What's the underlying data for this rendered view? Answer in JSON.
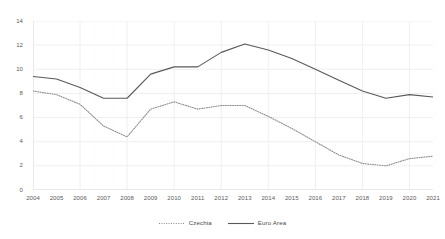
{
  "chart_data": {
    "type": "line",
    "title": "",
    "subtitle": "",
    "xlabel": "",
    "ylabel": "",
    "xlim": [
      2004,
      2021
    ],
    "ylim": [
      0,
      14
    ],
    "ytick_step": 2,
    "grid": true,
    "legend_position": "bottom",
    "x": [
      2004,
      2005,
      2006,
      2007,
      2008,
      2009,
      2010,
      2011,
      2012,
      2013,
      2014,
      2015,
      2016,
      2017,
      2018,
      2019,
      2020,
      2021
    ],
    "categories": [
      "2004",
      "2005",
      "2006",
      "2007",
      "2008",
      "2009",
      "2010",
      "2011",
      "2012",
      "2013",
      "2014",
      "2015",
      "2016",
      "2017",
      "2018",
      "2019",
      "2020",
      "2021"
    ],
    "yticks": [
      "0",
      "2",
      "4",
      "6",
      "8",
      "10",
      "12",
      "14"
    ],
    "ytick_values": [
      0,
      2,
      4,
      6,
      8,
      10,
      12,
      14
    ],
    "series": [
      {
        "name": "Czechia",
        "style": "dotted",
        "color": "#8c8c8c",
        "values": [
          8.2,
          7.9,
          7.1,
          5.3,
          4.4,
          6.7,
          7.3,
          6.7,
          7.0,
          7.0,
          6.1,
          5.1,
          4.0,
          2.9,
          2.2,
          2.0,
          2.6,
          2.8
        ]
      },
      {
        "name": "Euro Area",
        "style": "solid",
        "color": "#595959",
        "values": [
          9.4,
          9.2,
          8.5,
          7.6,
          7.6,
          9.6,
          10.2,
          10.2,
          11.4,
          12.1,
          11.6,
          10.9,
          10.0,
          9.1,
          8.2,
          7.6,
          7.9,
          7.7
        ]
      }
    ]
  },
  "legend": {
    "items": [
      {
        "label": "Czechia",
        "style": "dotted",
        "color": "#8c8c8c"
      },
      {
        "label": "Euro Area",
        "style": "solid",
        "color": "#595959"
      }
    ]
  },
  "colors": {
    "background": "#ffffff",
    "grid": "#eceff3",
    "axis_text": "#5a5a5a",
    "czechia": "#8c8c8c",
    "euro_area": "#595959"
  }
}
